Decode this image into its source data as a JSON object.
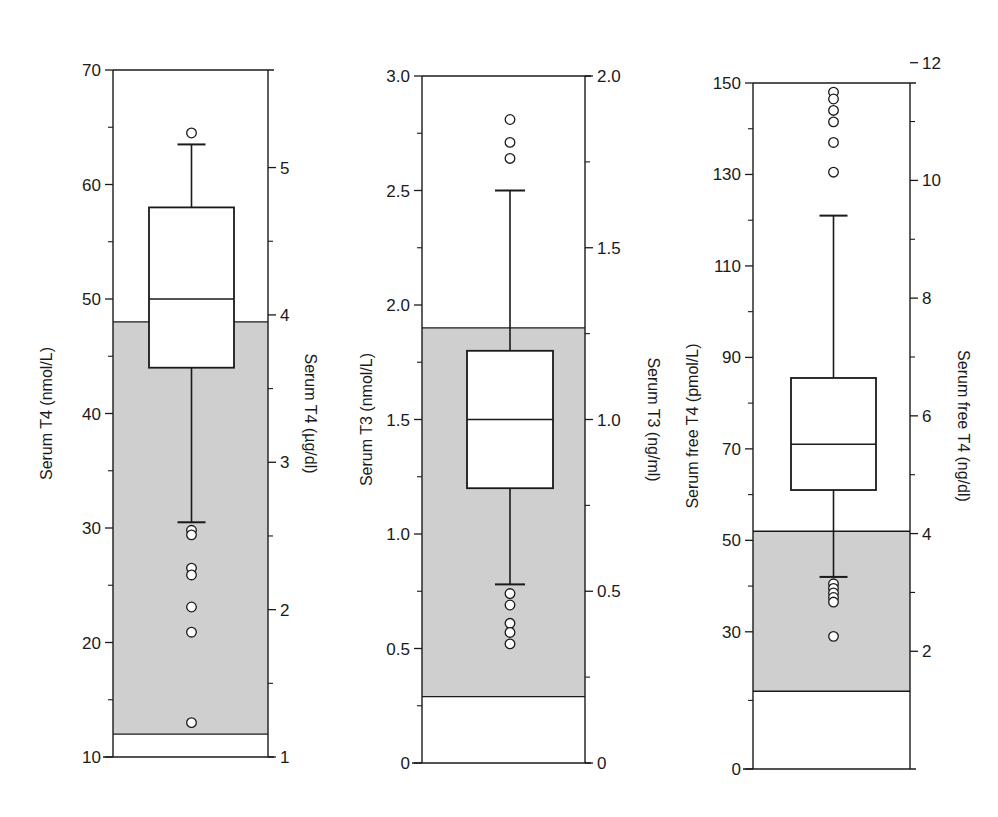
{
  "figure": {
    "background": "#ffffff",
    "shade_color": "#cfcfcf",
    "line_color": "#1a1a1a"
  },
  "chart_data": [
    {
      "type": "box",
      "title": "",
      "ylabel": "Serum T4 (nmol/L)",
      "ylabel_right": "Serum T4 (µg/dl)",
      "ylim": [
        10,
        70
      ],
      "yticks": [
        10,
        20,
        30,
        40,
        50,
        60,
        70
      ],
      "ytick_labels": [
        "10",
        "20",
        "30",
        "40",
        "50",
        "60",
        "70"
      ],
      "yticks_right": [
        1,
        2,
        3,
        4,
        5
      ],
      "ytick_labels_right": [
        "1",
        "2",
        "3",
        "4",
        "5"
      ],
      "reference_range": [
        12,
        48
      ],
      "box": {
        "whisker_low": 30.5,
        "q1": 44,
        "median": 50,
        "q3": 58,
        "whisker_high": 63.5
      },
      "outliers": [
        64.5,
        29.8,
        29.4,
        26.5,
        25.9,
        23.1,
        20.9,
        13.0
      ]
    },
    {
      "type": "box",
      "title": "",
      "ylabel": "Serum T3 (nmol/L)",
      "ylabel_right": "Serum T3 (ng/ml)",
      "ylim": [
        0,
        3.0
      ],
      "yticks": [
        0,
        0.5,
        1.0,
        1.5,
        2.0,
        2.5,
        3.0
      ],
      "ytick_labels": [
        "0",
        "0.5",
        "1.0",
        "1.5",
        "2.0",
        "2.5",
        "3.0"
      ],
      "yticks_right": [
        0,
        0.5,
        1.0,
        1.5,
        2.0
      ],
      "ytick_labels_right": [
        "0",
        "0.5",
        "1.0",
        "1.5",
        "2.0"
      ],
      "reference_range": [
        0.29,
        1.9
      ],
      "box": {
        "whisker_low": 0.78,
        "q1": 1.2,
        "median": 1.5,
        "q3": 1.8,
        "whisker_high": 2.5
      },
      "outliers": [
        2.81,
        2.71,
        2.64,
        0.74,
        0.69,
        0.61,
        0.57,
        0.52
      ]
    },
    {
      "type": "box",
      "title": "",
      "ylabel": "Serum free T4 (pmol/L)",
      "ylabel_right": "Serum free T4 (ng/dl)",
      "ylim": [
        0,
        150
      ],
      "yticks": [
        0,
        30,
        50,
        70,
        90,
        110,
        130,
        150
      ],
      "ytick_labels": [
        "0",
        "30",
        "50",
        "70",
        "90",
        "110",
        "130",
        "150"
      ],
      "yticks_right": [
        2,
        4,
        6,
        8,
        10,
        12
      ],
      "ytick_labels_right": [
        "2",
        "4",
        "6",
        "8",
        "10",
        "12"
      ],
      "reference_range": [
        17,
        52
      ],
      "box": {
        "whisker_low": 42,
        "q1": 61,
        "median": 71,
        "q3": 85.5,
        "whisker_high": 121
      },
      "outliers": [
        148,
        146.5,
        144,
        141.5,
        137,
        130.5,
        40.5,
        39.5,
        38.5,
        37.5,
        36.5,
        29
      ]
    }
  ]
}
